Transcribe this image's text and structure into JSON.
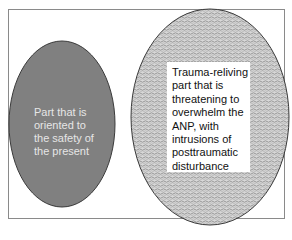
{
  "diagram": {
    "frame": {
      "border_color": "#8a8a8a"
    },
    "left_part": {
      "label": "Part that is\noriented to\nthe safety of\nthe present",
      "fill": "#808080",
      "text_color": "#e6e6e6"
    },
    "right_part": {
      "label": "Trauma-reliving\npart that is\nthreatening to\noverwhelm the\nANP, with\nintrusions of\nposttraumatic\ndisturbance",
      "fill_pattern": "wavy-hatch",
      "pattern_colors": [
        "#9a9a9a",
        "#dcdcdc"
      ],
      "text_color": "#111111"
    }
  }
}
